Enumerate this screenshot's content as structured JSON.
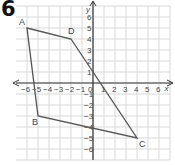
{
  "question_number": "6",
  "colors": {
    "grid": "#d9d9d9",
    "axis": "#333333",
    "shape": "#555555",
    "text": "#444444"
  },
  "axes": {
    "x_label": "x",
    "y_label": "y",
    "x_ticks": [
      "-6",
      "-5",
      "-4",
      "-3",
      "-2",
      "-1",
      "0",
      "1",
      "2",
      "3",
      "4",
      "5",
      "6"
    ],
    "y_ticks": [
      "6",
      "5",
      "4",
      "3",
      "2",
      "1",
      "-1",
      "-2",
      "-3",
      "-4",
      "-5",
      "-6"
    ],
    "x_range": [
      -6,
      6
    ],
    "y_range": [
      -6,
      6
    ]
  },
  "shape": {
    "vertices": [
      {
        "label": "A",
        "x": -6,
        "y": 5
      },
      {
        "label": "D",
        "x": -2,
        "y": 4
      },
      {
        "label": "C",
        "x": 4,
        "y": -5
      },
      {
        "label": "B",
        "x": -5,
        "y": -3
      }
    ]
  }
}
